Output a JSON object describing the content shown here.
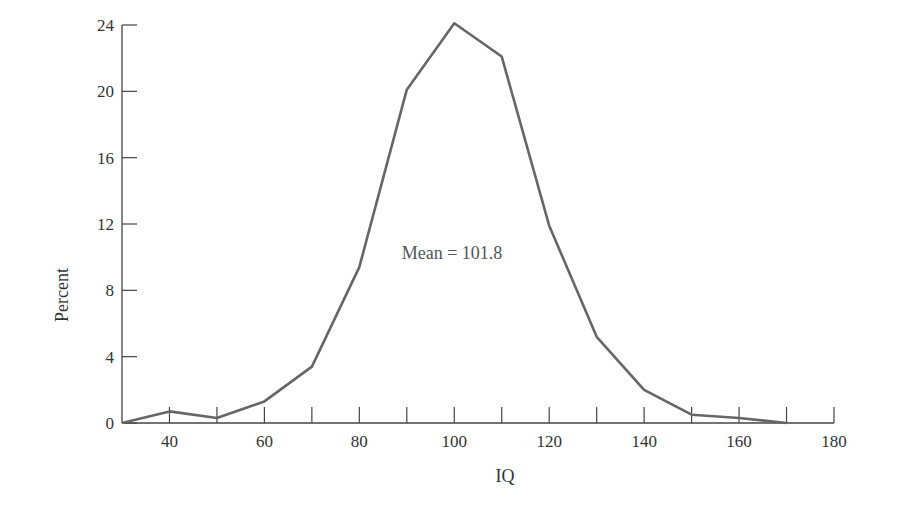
{
  "chart_data": {
    "type": "line",
    "title": "",
    "xlabel": "IQ",
    "ylabel": "Percent",
    "xlim": [
      30,
      180
    ],
    "ylim": [
      0,
      24
    ],
    "x_ticks": [
      40,
      60,
      80,
      100,
      120,
      140,
      160,
      180
    ],
    "x_minor_ticks": [
      40,
      50,
      60,
      70,
      80,
      90,
      100,
      110,
      120,
      130,
      140,
      150,
      160,
      170,
      180
    ],
    "y_ticks": [
      0,
      4,
      8,
      12,
      16,
      20,
      24
    ],
    "grid": false,
    "legend": null,
    "annotations": [
      {
        "text": "Mean = 101.8",
        "x": 102,
        "y": 10.5
      }
    ],
    "series": [
      {
        "name": "IQ distribution",
        "x": [
          30,
          40,
          50,
          60,
          70,
          80,
          90,
          100,
          110,
          120,
          130,
          140,
          150,
          160,
          170
        ],
        "values": [
          0,
          0.7,
          0.3,
          1.3,
          3.4,
          9.4,
          20.1,
          24.1,
          22.1,
          11.9,
          5.2,
          2.0,
          0.5,
          0.3,
          0
        ],
        "color": "#666666"
      }
    ]
  },
  "labels": {
    "xlabel": "IQ",
    "ylabel": "Percent",
    "annotation": "Mean = 101.8"
  }
}
